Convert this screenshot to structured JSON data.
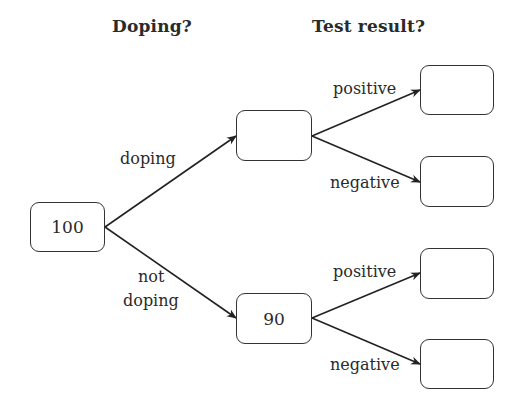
{
  "headers": {
    "stage1": "Doping?",
    "stage2": "Test result?"
  },
  "nodes": {
    "root": "100",
    "doping": "",
    "not_doping": "90",
    "doping_positive": "",
    "doping_negative": "",
    "not_doping_positive": "",
    "not_doping_negative": ""
  },
  "edges": {
    "doping": "doping",
    "not_doping_line1": "not",
    "not_doping_line2": "doping",
    "upper_positive": "positive",
    "upper_negative": "negative",
    "lower_positive": "positive",
    "lower_negative": "negative"
  }
}
